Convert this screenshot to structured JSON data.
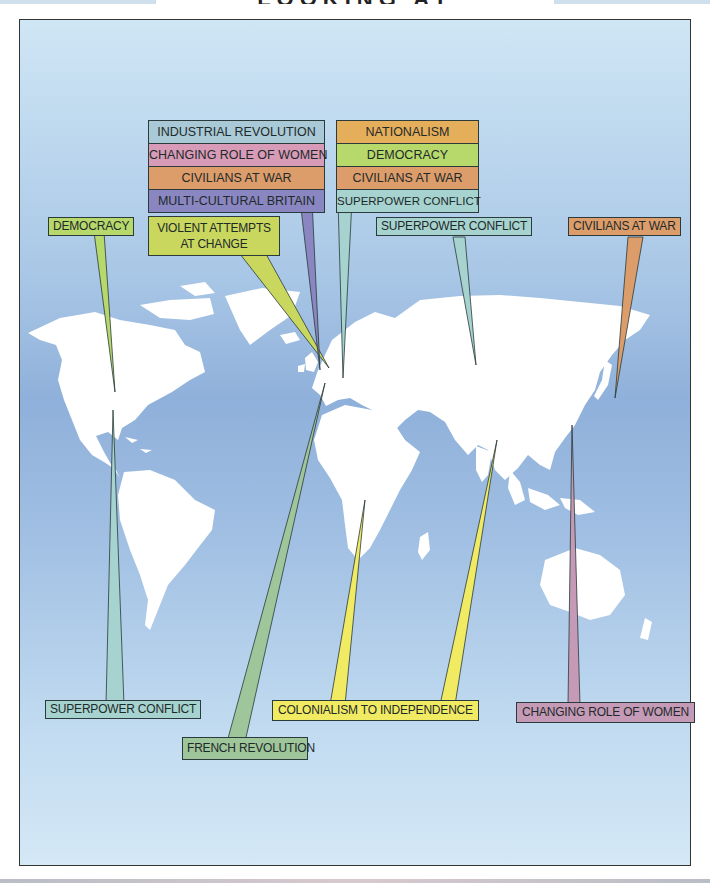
{
  "title": "LOOKING AT",
  "colors": {
    "ocean_top": "#cfe6f5",
    "ocean_mid": "#8fb0da",
    "land": "#ffffff",
    "industrial_revolution": "#a9c9d6",
    "changing_role_of_women": "#d79bb8",
    "civilians_at_war": "#dc9d6a",
    "multi_cultural_britain": "#8a86c1",
    "nationalism": "#e5ae5a",
    "democracy": "#b7d86b",
    "superpower_conflict": "#a6d3cf",
    "violent_attempts": "#c9d75f",
    "french_revolution": "#9fc59a",
    "colonialism": "#f1ea63",
    "women_pink": "#c59ab7"
  },
  "stacks": {
    "britain": {
      "rows": [
        "INDUSTRIAL REVOLUTION",
        "CHANGING ROLE OF WOMEN",
        "CIVILIANS AT WAR",
        "MULTI-CULTURAL BRITAIN"
      ]
    },
    "europe": {
      "rows": [
        "NATIONALISM",
        "DEMOCRACY",
        "CIVILIANS AT WAR",
        "SUPERPOWER CONFLICT"
      ]
    }
  },
  "labels": {
    "democracy_usa": "DEMOCRACY",
    "violent_attempts": "VIOLENT ATTEMPTS\nAT CHANGE",
    "violent_line1": "VIOLENT ATTEMPTS",
    "violent_line2": "AT CHANGE",
    "superpower_russia": "SUPERPOWER CONFLICT",
    "civilians_japan": "CIVILIANS AT WAR",
    "superpower_americas": "SUPERPOWER CONFLICT",
    "french_revolution": "FRENCH REVOLUTION",
    "colonialism": "COLONIALISM TO INDEPENDENCE",
    "women_china": "CHANGING ROLE OF WOMEN"
  }
}
